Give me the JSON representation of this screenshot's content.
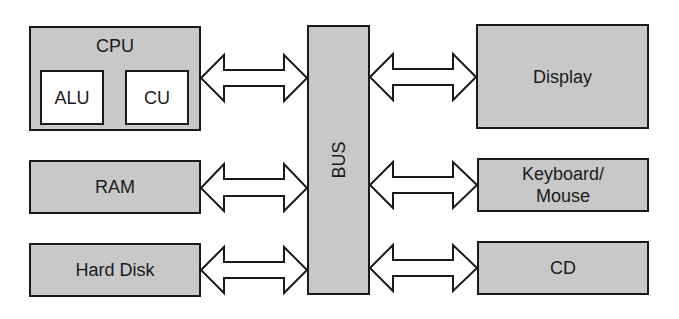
{
  "diagram": {
    "colors": {
      "box_fill": "#c8c8c8",
      "inner_fill": "#ffffff",
      "stroke": "#1a1a1a"
    },
    "cpu": {
      "label": "CPU",
      "alu": "ALU",
      "cu": "CU"
    },
    "bus": {
      "label": "BUS"
    },
    "left_components": [
      {
        "label": "RAM"
      },
      {
        "label": "Hard Disk"
      }
    ],
    "right_components": [
      {
        "label": "Display"
      },
      {
        "label": "Keyboard/ Mouse"
      },
      {
        "label": "CD"
      }
    ],
    "connections": [
      {
        "from": "CPU",
        "to": "BUS",
        "type": "bidirectional"
      },
      {
        "from": "RAM",
        "to": "BUS",
        "type": "bidirectional"
      },
      {
        "from": "Hard Disk",
        "to": "BUS",
        "type": "bidirectional"
      },
      {
        "from": "BUS",
        "to": "Display",
        "type": "bidirectional"
      },
      {
        "from": "BUS",
        "to": "Keyboard/ Mouse",
        "type": "bidirectional"
      },
      {
        "from": "BUS",
        "to": "CD",
        "type": "bidirectional"
      }
    ]
  }
}
